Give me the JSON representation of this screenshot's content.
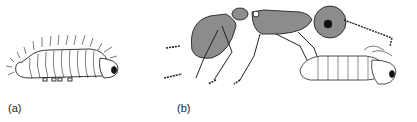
{
  "figure": {
    "panels": [
      {
        "label": "(a)",
        "subject": "larva-side-view"
      },
      {
        "label": "(b)",
        "subject": "ant-carrying-larva"
      }
    ],
    "colors": {
      "ink": "#222222",
      "body_fill": "#8c8c8c",
      "background": "#ffffff"
    }
  }
}
